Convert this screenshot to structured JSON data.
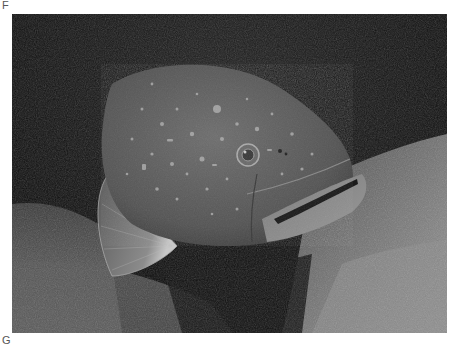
{
  "figure": {
    "panel_labels": {
      "top": "F",
      "bottom": "G"
    },
    "photo": {
      "subject": "grouper fish",
      "description": "Grayscale underwater photograph of a large mottled grouper swimming toward the viewer over rocky, algae-covered seabed",
      "tones": {
        "background_dark": "#0d0d0d",
        "rock_light": "#8a8a8a",
        "fish_body": "#5a5a5a",
        "spots": "#b5b5b5"
      }
    }
  }
}
